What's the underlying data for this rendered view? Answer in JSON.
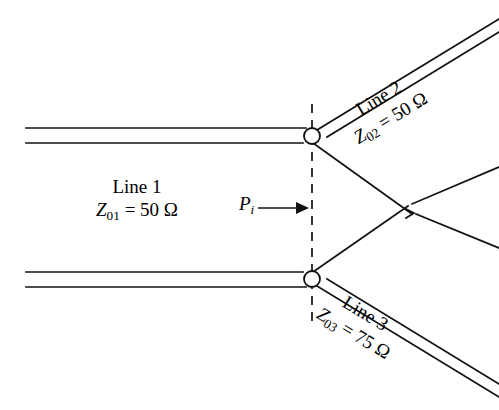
{
  "figure": {
    "type": "transmission-line-junction-diagram",
    "background_color": "#ffffff",
    "line_color": "#111111"
  },
  "labels": {
    "line1": {
      "name": "Line 1",
      "impedance_symbol": "Z",
      "impedance_subscript": "01",
      "equals": " = ",
      "impedance_value": "50",
      "impedance_unit": "Ω"
    },
    "line2": {
      "name": "Line 2",
      "impedance_symbol": "Z",
      "impedance_subscript": "02",
      "equals": " = ",
      "impedance_value": "50",
      "impedance_unit": "Ω"
    },
    "line3": {
      "name": "Line 3",
      "impedance_symbol": "Z",
      "impedance_subscript": "03",
      "equals": " = ",
      "impedance_value": "75",
      "impedance_unit": "Ω"
    },
    "incident_power": {
      "symbol": "P",
      "subscript": "i"
    }
  },
  "annotations": {
    "reference_plane": "dashed-vertical-line",
    "incident_power_arrow_direction": "right",
    "junction_nodes": 2,
    "crossover_nodes": 1
  }
}
